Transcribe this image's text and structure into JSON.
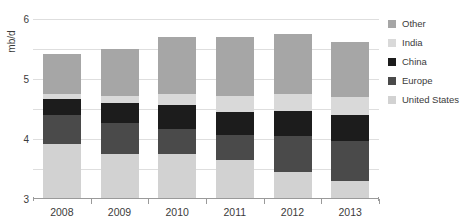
{
  "chart_data": {
    "type": "bar",
    "title": "",
    "xlabel": "",
    "ylabel": "mb/d",
    "ylim": [
      0,
      6
    ],
    "yticks": [
      1,
      2,
      3,
      4,
      5,
      6
    ],
    "grid": true,
    "stacked": true,
    "legend_position": "right",
    "categories": [
      "2008",
      "2009",
      "2010",
      "2011",
      "2012",
      "2013"
    ],
    "series": [
      {
        "name": "United States",
        "color": "#d2d2d2",
        "values": [
          1.85,
          1.5,
          1.5,
          1.3,
          0.9,
          0.6
        ]
      },
      {
        "name": "Europe",
        "color": "#4a4a4a",
        "values": [
          0.95,
          1.05,
          0.85,
          0.85,
          1.2,
          1.35
        ]
      },
      {
        "name": "China",
        "color": "#1c1c1c",
        "values": [
          0.55,
          0.65,
          0.8,
          0.75,
          0.85,
          0.85
        ]
      },
      {
        "name": "India",
        "color": "#d9d9d9",
        "values": [
          0.15,
          0.25,
          0.35,
          0.55,
          0.55,
          0.6
        ]
      },
      {
        "name": "Other",
        "color": "#a6a6a6",
        "values": [
          1.35,
          1.55,
          1.9,
          1.95,
          2.0,
          1.85
        ]
      }
    ],
    "totals": [
      4.85,
      5.0,
      5.4,
      5.4,
      5.5,
      5.25
    ]
  },
  "legend": {
    "items": [
      {
        "label": "Other",
        "color": "#a6a6a6"
      },
      {
        "label": "India",
        "color": "#d9d9d9"
      },
      {
        "label": "China",
        "color": "#1c1c1c"
      },
      {
        "label": "Europe",
        "color": "#4a4a4a"
      },
      {
        "label": "United States",
        "color": "#d2d2d2"
      }
    ]
  }
}
